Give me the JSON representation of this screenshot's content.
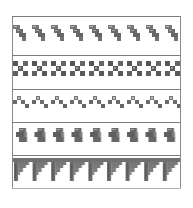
{
  "figure": {
    "description": "Five decorative geometric border patterns",
    "ink_color": "#6f6f6f",
    "dark_ink_color": "#555555",
    "line_color": "#7d7d7d",
    "background": "#ffffff",
    "bands": [
      {
        "name": "diagonal-staircase-blocks",
        "repeat_count": 9
      },
      {
        "name": "checkered-cross-motif",
        "repeat_count": 9
      },
      {
        "name": "zigzag-step-squares",
        "repeat_count": 9
      },
      {
        "name": "hooked-fret-motif",
        "repeat_count": 9
      },
      {
        "name": "stepped-pendant-fringe",
        "repeat_count": 9
      }
    ]
  }
}
